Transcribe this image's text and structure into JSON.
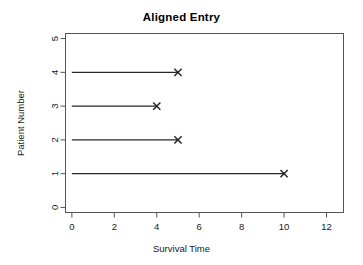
{
  "chart_data": {
    "type": "line",
    "title": "Aligned Entry",
    "xlabel": "Survival Time",
    "ylabel": "Patient Number",
    "xlim": [
      -0.3,
      12.8
    ],
    "ylim": [
      -0.15,
      5.15
    ],
    "xticks": [
      0,
      2,
      4,
      6,
      8,
      10,
      12
    ],
    "xtick_labels": [
      "0",
      "2",
      "4",
      "6",
      "8",
      "10",
      "12"
    ],
    "yticks": [
      0,
      1,
      2,
      3,
      4,
      5
    ],
    "ytick_labels": [
      "0",
      "1",
      "2",
      "3",
      "4",
      "5"
    ],
    "grid": false,
    "legend": "none",
    "marker": "x",
    "line_color": "#262626",
    "axis_color": "#555555",
    "background": "#ffffff",
    "series": [
      {
        "name": "Patient 1",
        "patient": 1,
        "entry_time": 0,
        "event_time": 10,
        "event": "x"
      },
      {
        "name": "Patient 2",
        "patient": 2,
        "entry_time": 0,
        "event_time": 5,
        "event": "x"
      },
      {
        "name": "Patient 3",
        "patient": 3,
        "entry_time": 0,
        "event_time": 4,
        "event": "x"
      },
      {
        "name": "Patient 4",
        "patient": 4,
        "entry_time": 0,
        "event_time": 5,
        "event": "x"
      }
    ]
  }
}
